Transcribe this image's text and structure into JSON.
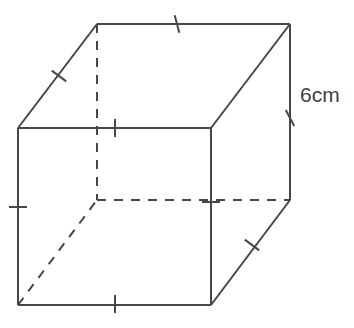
{
  "figure": {
    "kind": "cube-net-3d-diagram",
    "shape_name": "cube",
    "stroke_color": "#47474a",
    "background_color": "#ffffff",
    "stroke_width": 2,
    "hidden_edge_style": "dashed",
    "hidden_edge_dash": "9 8"
  },
  "labels": {
    "edge_length": "6cm"
  },
  "vertices": {
    "front_top_left": {
      "x": 18,
      "y": 128
    },
    "front_top_right": {
      "x": 211,
      "y": 128
    },
    "front_bottom_left": {
      "x": 18,
      "y": 305
    },
    "front_bottom_right": {
      "x": 211,
      "y": 305
    },
    "back_top_left": {
      "x": 97,
      "y": 24
    },
    "back_top_right": {
      "x": 290,
      "y": 24
    },
    "back_bottom_left": {
      "x": 97,
      "y": 200
    },
    "back_bottom_right": {
      "x": 290,
      "y": 200
    }
  },
  "edges": [
    {
      "name": "front-top-edge",
      "hidden": false,
      "from": "front_top_left",
      "to": "front_top_right"
    },
    {
      "name": "front-bottom-edge",
      "hidden": false,
      "from": "front_bottom_left",
      "to": "front_bottom_right"
    },
    {
      "name": "front-left-edge",
      "hidden": false,
      "from": "front_top_left",
      "to": "front_bottom_left"
    },
    {
      "name": "front-right-edge",
      "hidden": false,
      "from": "front_top_right",
      "to": "front_bottom_right"
    },
    {
      "name": "back-top-edge",
      "hidden": false,
      "from": "back_top_left",
      "to": "back_top_right"
    },
    {
      "name": "back-right-edge",
      "hidden": false,
      "from": "back_top_right",
      "to": "back_bottom_right"
    },
    {
      "name": "top-left-diagonal-edge",
      "hidden": false,
      "from": "front_top_left",
      "to": "back_top_left"
    },
    {
      "name": "top-right-diagonal-edge",
      "hidden": false,
      "from": "front_top_right",
      "to": "back_top_right"
    },
    {
      "name": "bottom-right-diagonal-edge",
      "hidden": false,
      "from": "front_bottom_right",
      "to": "back_bottom_right"
    },
    {
      "name": "back-left-edge-hidden",
      "hidden": true,
      "from": "back_top_left",
      "to": "back_bottom_left"
    },
    {
      "name": "back-bottom-edge-hidden",
      "hidden": true,
      "from": "back_bottom_left",
      "to": "back_bottom_right"
    },
    {
      "name": "bottom-left-diagonal-edge-hidden",
      "hidden": true,
      "from": "front_bottom_left",
      "to": "back_bottom_left"
    }
  ],
  "tick_marks": [
    {
      "name": "tick-front-top-edge",
      "x": 115,
      "y": 128,
      "angle": 90
    },
    {
      "name": "tick-front-bottom-edge",
      "x": 115,
      "y": 304,
      "angle": 90
    },
    {
      "name": "tick-front-left-edge",
      "x": 18,
      "y": 207,
      "angle": 0
    },
    {
      "name": "tick-front-right-edge",
      "x": 211,
      "y": 202,
      "angle": 0
    },
    {
      "name": "tick-back-top-edge",
      "x": 177,
      "y": 24,
      "angle": 75
    },
    {
      "name": "tick-back-right-edge",
      "x": 290,
      "y": 118,
      "angle": 62
    },
    {
      "name": "tick-top-left-diagonal",
      "x": 59,
      "y": 76,
      "angle": 37
    },
    {
      "name": "tick-bottom-right-diagonal",
      "x": 252,
      "y": 245,
      "angle": 37
    }
  ]
}
